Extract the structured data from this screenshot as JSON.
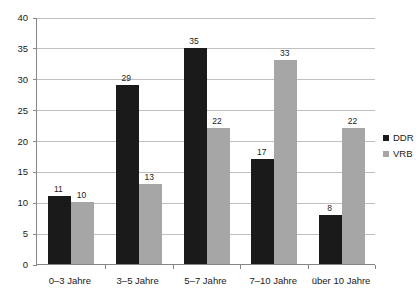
{
  "chart_data": {
    "type": "bar",
    "title": "",
    "subtitle": "",
    "xlabel": "",
    "ylabel": "",
    "categories": [
      "0–3 Jahre",
      "3–5 Jahre",
      "5–7 Jahre",
      "7–10 Jahre",
      "über 10 Jahre"
    ],
    "series": [
      {
        "name": "DDR",
        "color": "#1a1a1a",
        "values": [
          11,
          29,
          35,
          17,
          8
        ]
      },
      {
        "name": "VRB",
        "color": "#a6a6a6",
        "values": [
          10,
          13,
          22,
          33,
          22
        ]
      }
    ],
    "ylim": [
      0,
      40
    ],
    "ytick_step": 5,
    "yticks": [
      0,
      5,
      10,
      15,
      20,
      25,
      30,
      35,
      40
    ],
    "ytick_labels": [
      "0",
      "5",
      "10",
      "15",
      "20",
      "25",
      "30",
      "35",
      "40"
    ],
    "grid": true,
    "grid_color": "#bfbfbf",
    "axis_color": "#868686",
    "legend_position": "right",
    "data_labels": true,
    "background": "#ffffff"
  },
  "legend": {
    "entries": [
      {
        "label": "DDR",
        "marker": "square-swatch-black"
      },
      {
        "label": "VRB",
        "marker": "square-swatch-gray"
      }
    ]
  }
}
